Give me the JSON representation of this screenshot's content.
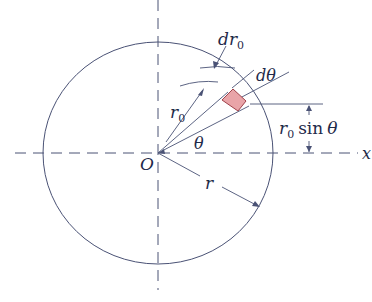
{
  "diagram": {
    "colors": {
      "line": "#4a5275",
      "text": "#1f2a4a",
      "element_fill": "#e9a4a8",
      "element_stroke": "#a0414a"
    },
    "labels": {
      "dr0": "dr",
      "dr0_sub": "0",
      "dtheta": "dθ",
      "r0": "r",
      "r0_sub": "0",
      "theta": "θ",
      "origin": "O",
      "r": "r",
      "r0_sin_theta_r": "r",
      "r0_sin_theta_sub": "0",
      "r0_sin_theta_fn": "sin",
      "r0_sin_theta_theta": "θ",
      "x_axis": "x"
    },
    "geometry": {
      "center": [
        158,
        153
      ],
      "radius": 112,
      "element_radius": 88,
      "theta_deg": 30,
      "dtheta_deg": 8
    }
  }
}
